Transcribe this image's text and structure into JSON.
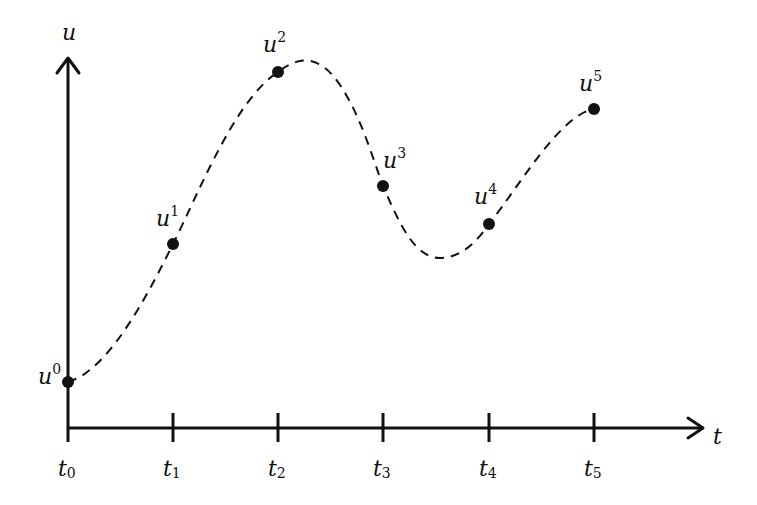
{
  "diagram": {
    "axes": {
      "y_label": "u",
      "x_label": "t",
      "origin": [
        68,
        428
      ],
      "y_arrow_tip": [
        68,
        58
      ],
      "x_arrow_tip": [
        703,
        428
      ]
    },
    "ticks": [
      {
        "name": "t",
        "sub": "0",
        "x": 68
      },
      {
        "name": "t",
        "sub": "1",
        "x": 173
      },
      {
        "name": "t",
        "sub": "2",
        "x": 278
      },
      {
        "name": "t",
        "sub": "3",
        "x": 383
      },
      {
        "name": "t",
        "sub": "4",
        "x": 489
      },
      {
        "name": "t",
        "sub": "5",
        "x": 594
      }
    ],
    "points": [
      {
        "name": "u",
        "sup": "0",
        "x": 68,
        "y": 382,
        "label_dx": -30,
        "label_dy": -16
      },
      {
        "name": "u",
        "sup": "1",
        "x": 173,
        "y": 244,
        "label_dx": -17,
        "label_dy": -36
      },
      {
        "name": "u",
        "sup": "2",
        "x": 278,
        "y": 72,
        "label_dx": -15,
        "label_dy": -38
      },
      {
        "name": "u",
        "sup": "3",
        "x": 383,
        "y": 186,
        "label_dx": 0,
        "label_dy": -36
      },
      {
        "name": "u",
        "sup": "4",
        "x": 489,
        "y": 224,
        "label_dx": -15,
        "label_dy": -38
      },
      {
        "name": "u",
        "sup": "5",
        "x": 594,
        "y": 109,
        "label_dx": -15,
        "label_dy": -36
      }
    ],
    "curve_style": "dashed",
    "colors": {
      "ink": "#111111",
      "background": "#ffffff"
    }
  }
}
